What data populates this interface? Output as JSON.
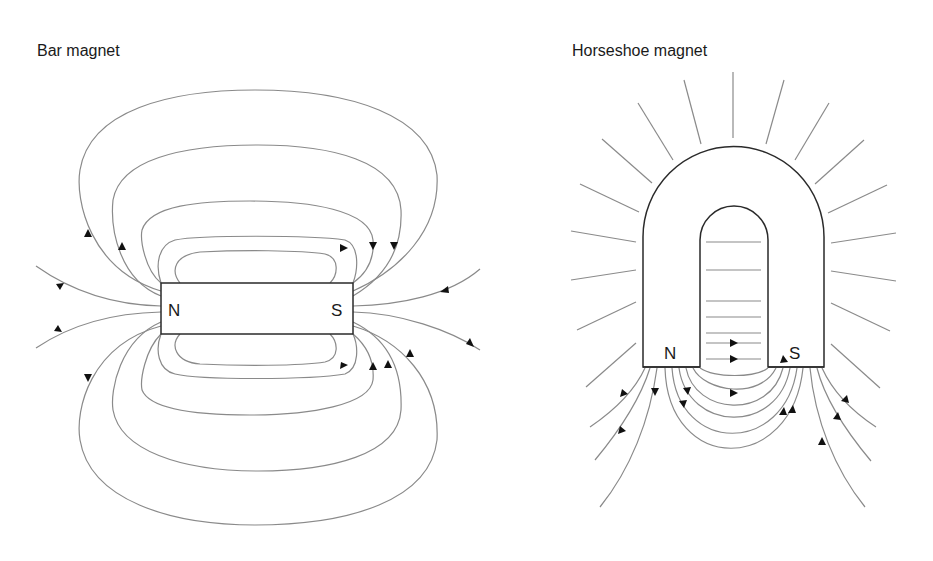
{
  "bar_magnet": {
    "title": "Bar magnet",
    "north_label": "N",
    "south_label": "S",
    "field_direction": "N to S outside the magnet"
  },
  "horseshoe_magnet": {
    "title": "Horseshoe magnet",
    "north_label": "N",
    "south_label": "S",
    "field_direction": "N to S across the gap"
  },
  "colors": {
    "field_line": "#8a8a8a",
    "magnet_outline": "#2a2a2a",
    "arrow": "#111111",
    "text": "#1a1a1a",
    "background": "#ffffff"
  }
}
